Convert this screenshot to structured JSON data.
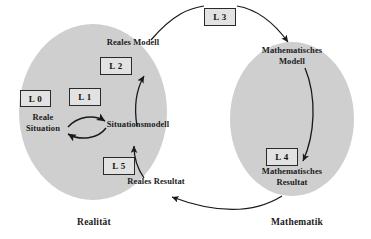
{
  "diagram": {
    "domain_left": {
      "caption": "Realität",
      "fill_color": "#cfcfcf"
    },
    "domain_right": {
      "caption": "Mathematik",
      "fill_color": "#cfcfcf"
    },
    "nodes": [
      {
        "id": "reale-situation",
        "label": "Reale\nSituation"
      },
      {
        "id": "situationsmodell",
        "label": "Situationsmodell"
      },
      {
        "id": "reales-modell",
        "label": "Reales Modell"
      },
      {
        "id": "mathematisches-modell",
        "label": "Mathematisches\nModell"
      },
      {
        "id": "mathematisches-resultat",
        "label": "Mathematisches\nResultat"
      },
      {
        "id": "reales-resultat",
        "label": "Reales Resultat"
      }
    ],
    "step_boxes": [
      {
        "id": "l0",
        "label": "L 0"
      },
      {
        "id": "l1",
        "label": "L 1"
      },
      {
        "id": "l2",
        "label": "L 2"
      },
      {
        "id": "l3",
        "label": "L 3"
      },
      {
        "id": "l4",
        "label": "L 4"
      },
      {
        "id": "l5",
        "label": "L 5"
      }
    ],
    "colors": {
      "stroke": "#1a1a1a",
      "text": "#1b1b1b",
      "box_fill": "#e2e2e2",
      "background": "#ffffff"
    }
  }
}
